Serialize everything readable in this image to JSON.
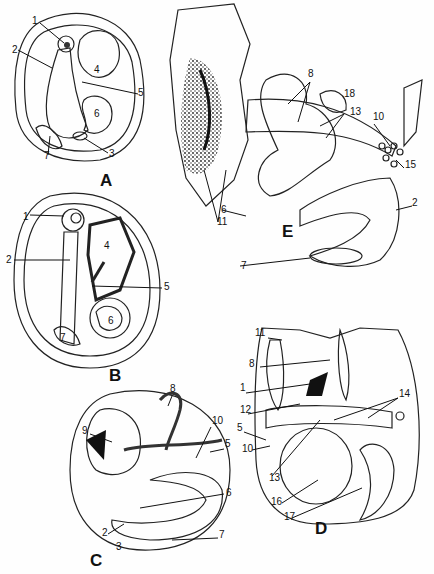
{
  "figure": {
    "panels": [
      {
        "id": "A",
        "label": "A",
        "pos": [
          100,
          186
        ],
        "parts": [
          {
            "n": "1",
            "x": 32,
            "y": 24
          },
          {
            "n": "2",
            "x": 12,
            "y": 53
          },
          {
            "n": "3",
            "x": 109,
            "y": 157
          },
          {
            "n": "4",
            "x": 94,
            "y": 73
          },
          {
            "n": "5",
            "x": 138,
            "y": 96
          },
          {
            "n": "6",
            "x": 94,
            "y": 117
          },
          {
            "n": "7",
            "x": 44,
            "y": 159
          }
        ]
      },
      {
        "id": "B",
        "label": "B",
        "pos": [
          109,
          381
        ],
        "parts": [
          {
            "n": "1",
            "x": 23,
            "y": 220
          },
          {
            "n": "2",
            "x": 6,
            "y": 263
          },
          {
            "n": "4",
            "x": 104,
            "y": 249
          },
          {
            "n": "5",
            "x": 164,
            "y": 290
          },
          {
            "n": "6",
            "x": 108,
            "y": 324
          },
          {
            "n": "7",
            "x": 60,
            "y": 341
          }
        ]
      },
      {
        "id": "C",
        "label": "C",
        "pos": [
          90,
          566
        ],
        "parts": [
          {
            "n": "2",
            "x": 102,
            "y": 536
          },
          {
            "n": "3",
            "x": 116,
            "y": 550
          },
          {
            "n": "5",
            "x": 225,
            "y": 447
          },
          {
            "n": "6",
            "x": 226,
            "y": 496
          },
          {
            "n": "7",
            "x": 219,
            "y": 538
          },
          {
            "n": "8",
            "x": 170,
            "y": 392
          },
          {
            "n": "9",
            "x": 82,
            "y": 434
          },
          {
            "n": "10",
            "x": 212,
            "y": 424
          }
        ]
      },
      {
        "id": "D",
        "label": "D",
        "pos": [
          315,
          534
        ],
        "parts": [
          {
            "n": "1",
            "x": 240,
            "y": 391
          },
          {
            "n": "5",
            "x": 237,
            "y": 431
          },
          {
            "n": "8",
            "x": 249,
            "y": 367
          },
          {
            "n": "10",
            "x": 242,
            "y": 452
          },
          {
            "n": "11",
            "x": 255,
            "y": 336
          },
          {
            "n": "12",
            "x": 240,
            "y": 413
          },
          {
            "n": "13",
            "x": 269,
            "y": 481
          },
          {
            "n": "14",
            "x": 399,
            "y": 397
          },
          {
            "n": "16",
            "x": 271,
            "y": 505
          },
          {
            "n": "17",
            "x": 284,
            "y": 520
          }
        ]
      },
      {
        "id": "E",
        "label": "E",
        "pos": [
          282,
          237
        ],
        "parts": [
          {
            "n": "2",
            "x": 412,
            "y": 206
          },
          {
            "n": "6",
            "x": 221,
            "y": 213
          },
          {
            "n": "7",
            "x": 241,
            "y": 269
          },
          {
            "n": "8",
            "x": 308,
            "y": 77
          },
          {
            "n": "10",
            "x": 373,
            "y": 120
          },
          {
            "n": "11",
            "x": 217,
            "y": 225
          },
          {
            "n": "13",
            "x": 350,
            "y": 115
          },
          {
            "n": "15",
            "x": 405,
            "y": 168
          },
          {
            "n": "18",
            "x": 344,
            "y": 97
          }
        ]
      }
    ]
  }
}
